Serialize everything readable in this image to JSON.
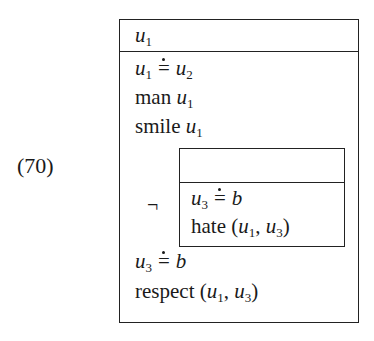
{
  "example_number": "(70)",
  "drs": {
    "universe": {
      "var": "u",
      "sub": "1"
    },
    "conditions": [
      {
        "type": "equation",
        "lhs": {
          "var": "u",
          "sub": "1"
        },
        "op": "≐",
        "rhs": {
          "var": "u",
          "sub": "2"
        }
      },
      {
        "type": "predicate",
        "pred": "man",
        "args": "u1"
      },
      {
        "type": "predicate",
        "pred": "smile",
        "args": "u1"
      },
      {
        "type": "negation",
        "symbol": "¬",
        "sub_drs": {
          "universe": "",
          "conditions": [
            {
              "type": "equation",
              "lhs": {
                "var": "u",
                "sub": "3"
              },
              "op": "≐",
              "rhs": "b"
            },
            {
              "type": "predicate",
              "pred": "hate",
              "args": "(u1, u3)"
            }
          ]
        }
      },
      {
        "type": "equation",
        "lhs": {
          "var": "u",
          "sub": "3"
        },
        "op": "≐",
        "rhs": "b"
      },
      {
        "type": "predicate",
        "pred": "respect",
        "args": "(u1, u3)"
      }
    ]
  },
  "text": {
    "pred_man": "man",
    "pred_smile": "smile",
    "pred_hate": "hate",
    "pred_respect": "respect",
    "neg": "¬",
    "var_u": "u",
    "var_b": "b",
    "s1": "1",
    "s2": "2",
    "s3": "3",
    "eq": "=",
    "lp": "(",
    "rp": ")",
    "comma": ", "
  }
}
